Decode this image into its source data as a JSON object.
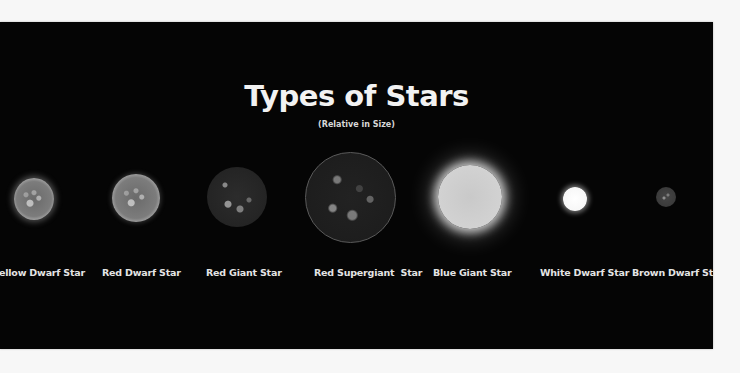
{
  "infographic": {
    "title": "Types of Stars",
    "subtitle": "(Relative in Size)",
    "background_color": "#050505",
    "stars": [
      {
        "label": "Yellow Dwarf Star",
        "visible_label": "ellow Dwarf Star",
        "relative_size": "small-medium"
      },
      {
        "label": "Red Dwarf Star",
        "relative_size": "medium"
      },
      {
        "label": "Red Giant Star",
        "relative_size": "large"
      },
      {
        "label": "Red Supergiant  Star",
        "relative_size": "largest"
      },
      {
        "label": "Blue Giant Star",
        "relative_size": "large"
      },
      {
        "label": "White Dwarf Star",
        "relative_size": "small"
      },
      {
        "label": "Brown Dwarf Star",
        "relative_size": "smallest"
      }
    ]
  }
}
